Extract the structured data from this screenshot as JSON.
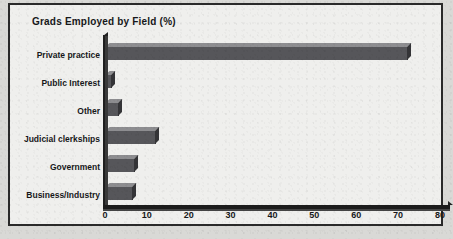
{
  "chart_data": {
    "type": "bar",
    "orientation": "horizontal",
    "title": "Grads Employed by Field (%)",
    "xlabel": "",
    "ylabel": "",
    "categories": [
      "Private practice",
      "Public Interest",
      "Other",
      "Judicial clerkships",
      "Government",
      "Business/Industry"
    ],
    "values": [
      72,
      1.5,
      3,
      12,
      7,
      6.5
    ],
    "xlim": [
      0,
      80
    ],
    "xticks": [
      0,
      10,
      20,
      30,
      40,
      50,
      60,
      70,
      80
    ],
    "xtick_labels": [
      "0",
      "10",
      "20",
      "30",
      "40",
      "50",
      "60",
      "70",
      "80"
    ],
    "grid": false,
    "legend": null,
    "style": "3d-bars-grayscale",
    "colors": {
      "bar_front": "#56565a",
      "bar_top": "#8d8d90",
      "bar_side": "#343437",
      "axis": "#1c1c1c",
      "text": "#17181a",
      "plot_background": "#efefed",
      "frame_border": "#2a2a2a",
      "page_background": "#d9d9d6"
    }
  }
}
